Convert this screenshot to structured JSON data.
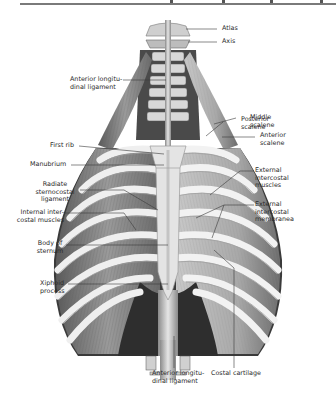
{
  "figure": {
    "labels": {
      "atlas": "Atlas",
      "axis": "Axis",
      "ant_long_lig_top": "Anterior longitu-\ndinal ligament",
      "posterior_scalene": "Posterior\nscalene",
      "middle_scalene": "Middle\nscalene",
      "anterior_scalene": "Anterior\nscalene",
      "first_rib": "First rib",
      "manubrium": "Manubrium",
      "radiate_lig": "Radiate\nsternocostal\nligament",
      "ext_intercostal_muscles": "External\nintercostal\nmuscles",
      "ext_intercostal_membrane": "External\nintercostal\nmembranea",
      "int_intercostal": "Internal inter-\ncostal muscles",
      "body_sternum": "Body of\nsternum",
      "xiphoid": "Xiphoid\nprocess",
      "ant_long_lig_bottom": "Anterior longitu-\ndinal ligament",
      "costal_cartilage": "Costal cartilage"
    },
    "colors": {
      "text": "#2a2a2a",
      "leader": "#3a3a3a",
      "bone": "#e9e9e9",
      "muscle": "#8a8a8a",
      "shadow": "#3c3c3c"
    }
  }
}
